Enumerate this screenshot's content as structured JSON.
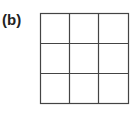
{
  "figure": {
    "label": "(b)",
    "grid": {
      "rows": 3,
      "cols": 3,
      "line_color": "#444444",
      "background": "#ffffff"
    }
  }
}
